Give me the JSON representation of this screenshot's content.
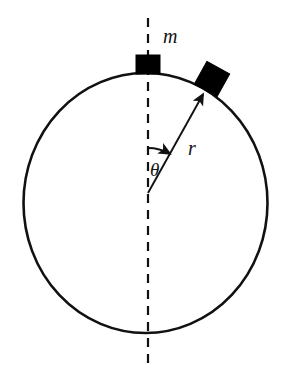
{
  "figure": {
    "type": "physics-diagram",
    "background_color": "#ffffff",
    "stroke_color": "#111111",
    "fill_color": "#000000"
  },
  "labels": {
    "mass": "m",
    "radius": "r",
    "angle": "θ"
  },
  "geometry": {
    "circle": {
      "name": "hoop",
      "center_x": 145.5,
      "center_y": 203,
      "radius_x": 122,
      "radius_y": 130,
      "stroke_width": 2.6
    },
    "axis": {
      "name": "vertical-dashed-axis",
      "x": 148,
      "y_top": 18,
      "y_bottom": 370,
      "dash": "9 7",
      "stroke_width": 2.2
    },
    "pivot": {
      "name": "angle-vertex",
      "x": 148,
      "y": 193
    },
    "radius_arrow": {
      "name": "radius-vector",
      "x1": 148,
      "y1": 193,
      "x2": 206,
      "y2": 89,
      "stroke_width": 1.9,
      "angle_from_vertical_deg": 29
    },
    "angle_arc": {
      "name": "angle-arc-arrow",
      "center_x": 148,
      "center_y": 193,
      "radius": 45,
      "start_deg": -90,
      "end_deg": -61,
      "stroke_width": 1.9
    },
    "block_top": {
      "name": "top-mass-block",
      "x": 136,
      "y": 55,
      "width": 24,
      "height": 19,
      "rotation_deg": 0
    },
    "block_angled": {
      "name": "angled-mass-block",
      "center_x": 212,
      "center_y": 79,
      "size": 26,
      "rotation_deg": 29
    }
  }
}
